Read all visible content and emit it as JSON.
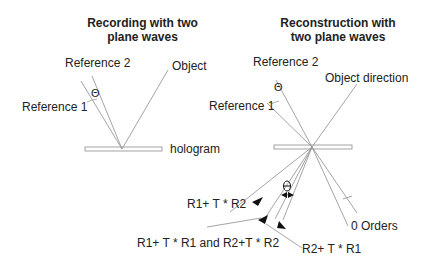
{
  "left_panel": {
    "title_line1": "Recording with two",
    "title_line2": "plane waves",
    "labels": {
      "reference2": "Reference 2",
      "reference1": "Reference 1",
      "object": "Object",
      "theta": "Θ",
      "hologram": "hologram"
    }
  },
  "right_panel": {
    "title_line1": "Reconstruction with",
    "title_line2": "two plane waves",
    "labels": {
      "reference2": "Reference 2",
      "reference1": "Reference 1",
      "object_direction": "Object direction",
      "theta": "Θ",
      "zero_orders": "0 Orders",
      "r1_t_r2": "R1+ T * R2",
      "r1_t_r1_and_r2_t_r2": "R1+ T * R1 and R2+T * R2",
      "r2_t_r1": "R2+ T * R1"
    }
  },
  "colors": {
    "line": "#9a9a9a",
    "text": "#222222",
    "arrow": "#111111"
  }
}
